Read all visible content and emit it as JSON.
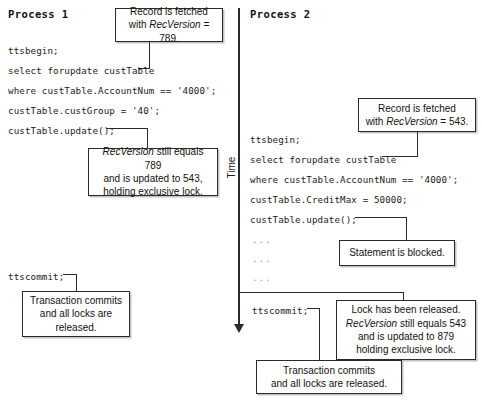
{
  "diagram": {
    "time_axis_label": "Time",
    "processes": [
      {
        "title": "Process 1",
        "code_lines": [
          "ttsbegin;",
          "select forupdate custTable",
          "where custTable.AccountNum == '4000';",
          "custTable.custGroup = '40';",
          "custTable.update();"
        ],
        "commit_line": "ttscommit;"
      },
      {
        "title": "Process 2",
        "code_lines": [
          "ttsbegin;",
          "select forupdate custTable",
          "where custTable.AccountNum == '4000';",
          "custTable.CreditMax = 50000;",
          "custTable.update();"
        ],
        "ellipsis_lines": [
          "...",
          "...",
          "..."
        ],
        "commit_line": "ttscommit;"
      }
    ],
    "callouts": {
      "p1_fetch": {
        "line1": "Record is fetched",
        "line2_pre": "with ",
        "line2_em": "RecVersion",
        "line2_post": " = 789."
      },
      "p1_update": {
        "line1_em": "RecVersion",
        "line1_post": " still equals 789",
        "line2": "and is updated to 543,",
        "line3": "holding exclusive lock."
      },
      "p1_commit": {
        "line1": "Transaction commits",
        "line2": "and all locks are",
        "line3": "released."
      },
      "p2_fetch": {
        "line1": "Record is fetched",
        "line2_pre": "with ",
        "line2_em": "RecVersion",
        "line2_post": " = 543."
      },
      "p2_blocked": {
        "line1": "Statement is blocked."
      },
      "p2_released": {
        "line1": "Lock has been released.",
        "line2_em": "RecVersion",
        "line2_post": " still equals 543",
        "line3": "and is updated to 879",
        "line4": "holding exclusive lock."
      },
      "p2_commit": {
        "line1": "Transaction commits",
        "line2": "and all locks are released."
      }
    }
  }
}
